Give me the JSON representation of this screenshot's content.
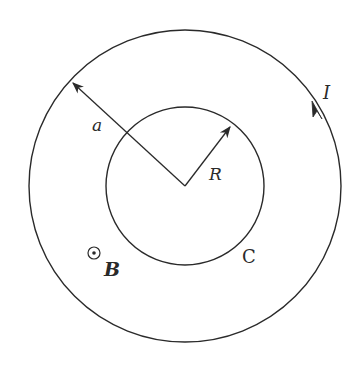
{
  "diagram": {
    "labels": {
      "outer_radius": "a",
      "inner_radius": "R",
      "current": "I",
      "loop": "C",
      "field": "B"
    },
    "center": [
      185,
      186
    ],
    "outer_circle_radius_px": 156,
    "inner_circle_radius_px": 79,
    "current_direction": "counterclockwise",
    "field_direction": "out-of-page",
    "stroke_color": "#2a2a2a"
  }
}
